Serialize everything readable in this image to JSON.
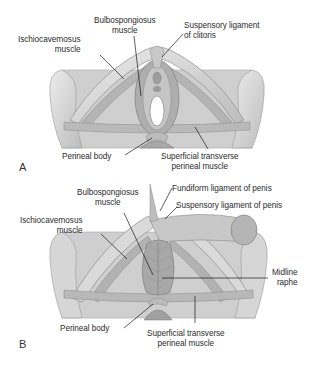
{
  "figure": {
    "colors": {
      "tissue": "#c9c9c9",
      "tissue_dark": "#9a9a9a",
      "bone": "#dcdcdc",
      "leader_line": "#1a1a1a",
      "label_text": "#2b2b2b"
    },
    "panels": [
      {
        "letter": "A",
        "title": "Female superficial perineal muscles",
        "labels": {
          "ischiocavernosus_1": "Ischiocavernosus",
          "ischiocavernosus_2": "muscle",
          "bulbospongiosus_1": "Bulbospongiosus",
          "bulbospongiosus_2": "muscle",
          "suspensory_1": "Suspensory ligament",
          "suspensory_2": "of clitoris",
          "perineal_body": "Perineal body",
          "superficial_1": "Superficial transverse",
          "superficial_2": "perineal muscle"
        }
      },
      {
        "letter": "B",
        "title": "Male superficial perineal muscles",
        "labels": {
          "bulbospongiosus_1": "Bulbospongiosus",
          "bulbospongiosus_2": "muscle",
          "fundiform": "Fundiform ligament of penis",
          "suspensory": "Suspensory ligament of penis",
          "ischiocavernosus_1": "Ischiocavernosus",
          "ischiocavernosus_2": "muscle",
          "midline_1": "Midline",
          "midline_2": "raphe",
          "perineal_body": "Perineal body",
          "superficial_1": "Superficial transverse",
          "superficial_2": "perineal muscle"
        }
      }
    ]
  }
}
